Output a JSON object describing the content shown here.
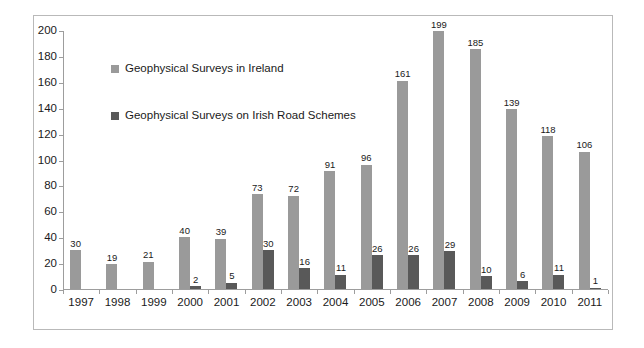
{
  "chart_data": {
    "type": "bar",
    "title": "",
    "subtitle": "",
    "xlabel": "",
    "ylabel": "",
    "ylim": [
      0,
      200
    ],
    "ytick_step": 20,
    "yticks": [
      "0",
      "20",
      "40",
      "60",
      "80",
      "100",
      "120",
      "140",
      "160",
      "180",
      "200"
    ],
    "grid": false,
    "legend_position": "inside-upper-left",
    "categories": [
      "1997",
      "1998",
      "1999",
      "2000",
      "2001",
      "2002",
      "2003",
      "2004",
      "2005",
      "2006",
      "2007",
      "2008",
      "2009",
      "2010",
      "2011"
    ],
    "series": [
      {
        "name": "Geophysical Surveys in Ireland",
        "color": "#9a9a9a",
        "values": [
          30,
          19,
          21,
          40,
          39,
          73,
          72,
          91,
          96,
          161,
          199,
          185,
          139,
          118,
          106
        ]
      },
      {
        "name": "Geophysical Surveys on Irish Road Schemes",
        "color": "#595959",
        "values": [
          null,
          null,
          null,
          2,
          5,
          30,
          16,
          11,
          26,
          26,
          29,
          10,
          6,
          11,
          1
        ]
      }
    ],
    "data_labels": {
      "series_a": [
        "30",
        "19",
        "21",
        "40",
        "39",
        "73",
        "72",
        "91",
        "96",
        "161",
        "199",
        "185",
        "139",
        "118",
        "106"
      ],
      "series_b": [
        "",
        "",
        "",
        "2",
        "5",
        "30",
        "16",
        "11",
        "26",
        "26",
        "29",
        "10",
        "6",
        "11",
        "1"
      ]
    }
  },
  "legend": {
    "items": [
      {
        "label": "Geophysical Surveys in Ireland",
        "color": "#9a9a9a"
      },
      {
        "label": "Geophysical Surveys on Irish Road Schemes",
        "color": "#595959"
      }
    ]
  },
  "colors": {
    "series_a": "#9a9a9a",
    "series_b": "#595959",
    "axis": "#9d9d9d",
    "border": "#b9b9b9",
    "text": "#1a1a1a",
    "background": "#ffffff"
  }
}
